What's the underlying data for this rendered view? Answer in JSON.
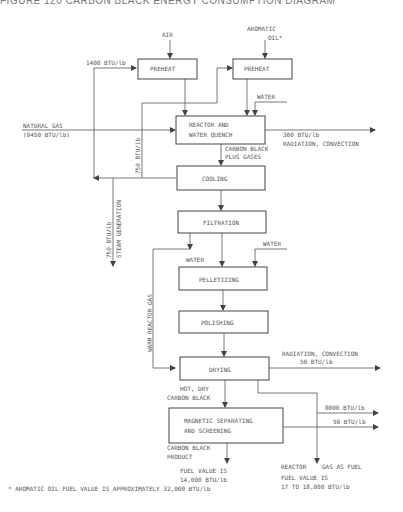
{
  "title": "FIGURE 120  CARBON BLACK ENERGY CONSUMPTION DIAGRAM",
  "inputs": {
    "air": "AIR",
    "aromatic_oil_1": "AROMATIC",
    "aromatic_oil_2": "OIL*",
    "natural_gas_1": "NATURAL GAS",
    "natural_gas_2": "(9450 BTU/lb)",
    "water_1": "WATER",
    "water_2": "WATER",
    "water_3": "WATER"
  },
  "boxes": {
    "preheat_air": "PREHEAT",
    "preheat_oil": "PREHEAT",
    "reactor_1": "REACTOR AND",
    "reactor_2": "WATER QUENCH",
    "cooling": "COOLING",
    "filtration": "FILTRATION",
    "pelletizing": "PELLETIZING",
    "polishing": "POLISHING",
    "drying": "DRYING",
    "magnetic_1": "MAGNETIC SEPARATING",
    "magnetic_2": "AND SCREENING"
  },
  "labels": {
    "preheat_energy": "1400 BTU/lb",
    "reactor_loss_1": "300 BTU/lb",
    "reactor_loss_2": "RADIATION, CONVECTION",
    "carbon_gases_1": "CARBON BLACK",
    "carbon_gases_2": "PLUS GASES",
    "recycle_750": "750 BTU/lb",
    "steam_1": "750 BTU/lb",
    "steam_2": "STEAM GENERATION",
    "warm_gas": "WARM REACTOR GAS",
    "drying_loss_1": "RADIATION, CONVECTION",
    "drying_loss_2": "50 BTU/lb",
    "hot_dry_1": "HOT, DRY",
    "hot_dry_2": "CARBON BLACK",
    "gas_8000": "8000 BTU/lb",
    "gas_50": "50 BTU/lb",
    "product_1": "CARBON BLACK",
    "product_2": "PRODUCT",
    "fuel_value_1": "FUEL VALUE IS",
    "fuel_value_2": "14,000 BTU/lb",
    "reactor_gas_1": "REACTOR",
    "reactor_gas_2": "GAS AS FUEL",
    "reactor_fuel_1": "FUEL VALUE IS",
    "reactor_fuel_2": "17 TO 18,000 BTU/lb"
  },
  "footnote": "* AROMATIC OIL FUEL VALUE IS APPROXIMATELY 32,000 BTU/lb"
}
